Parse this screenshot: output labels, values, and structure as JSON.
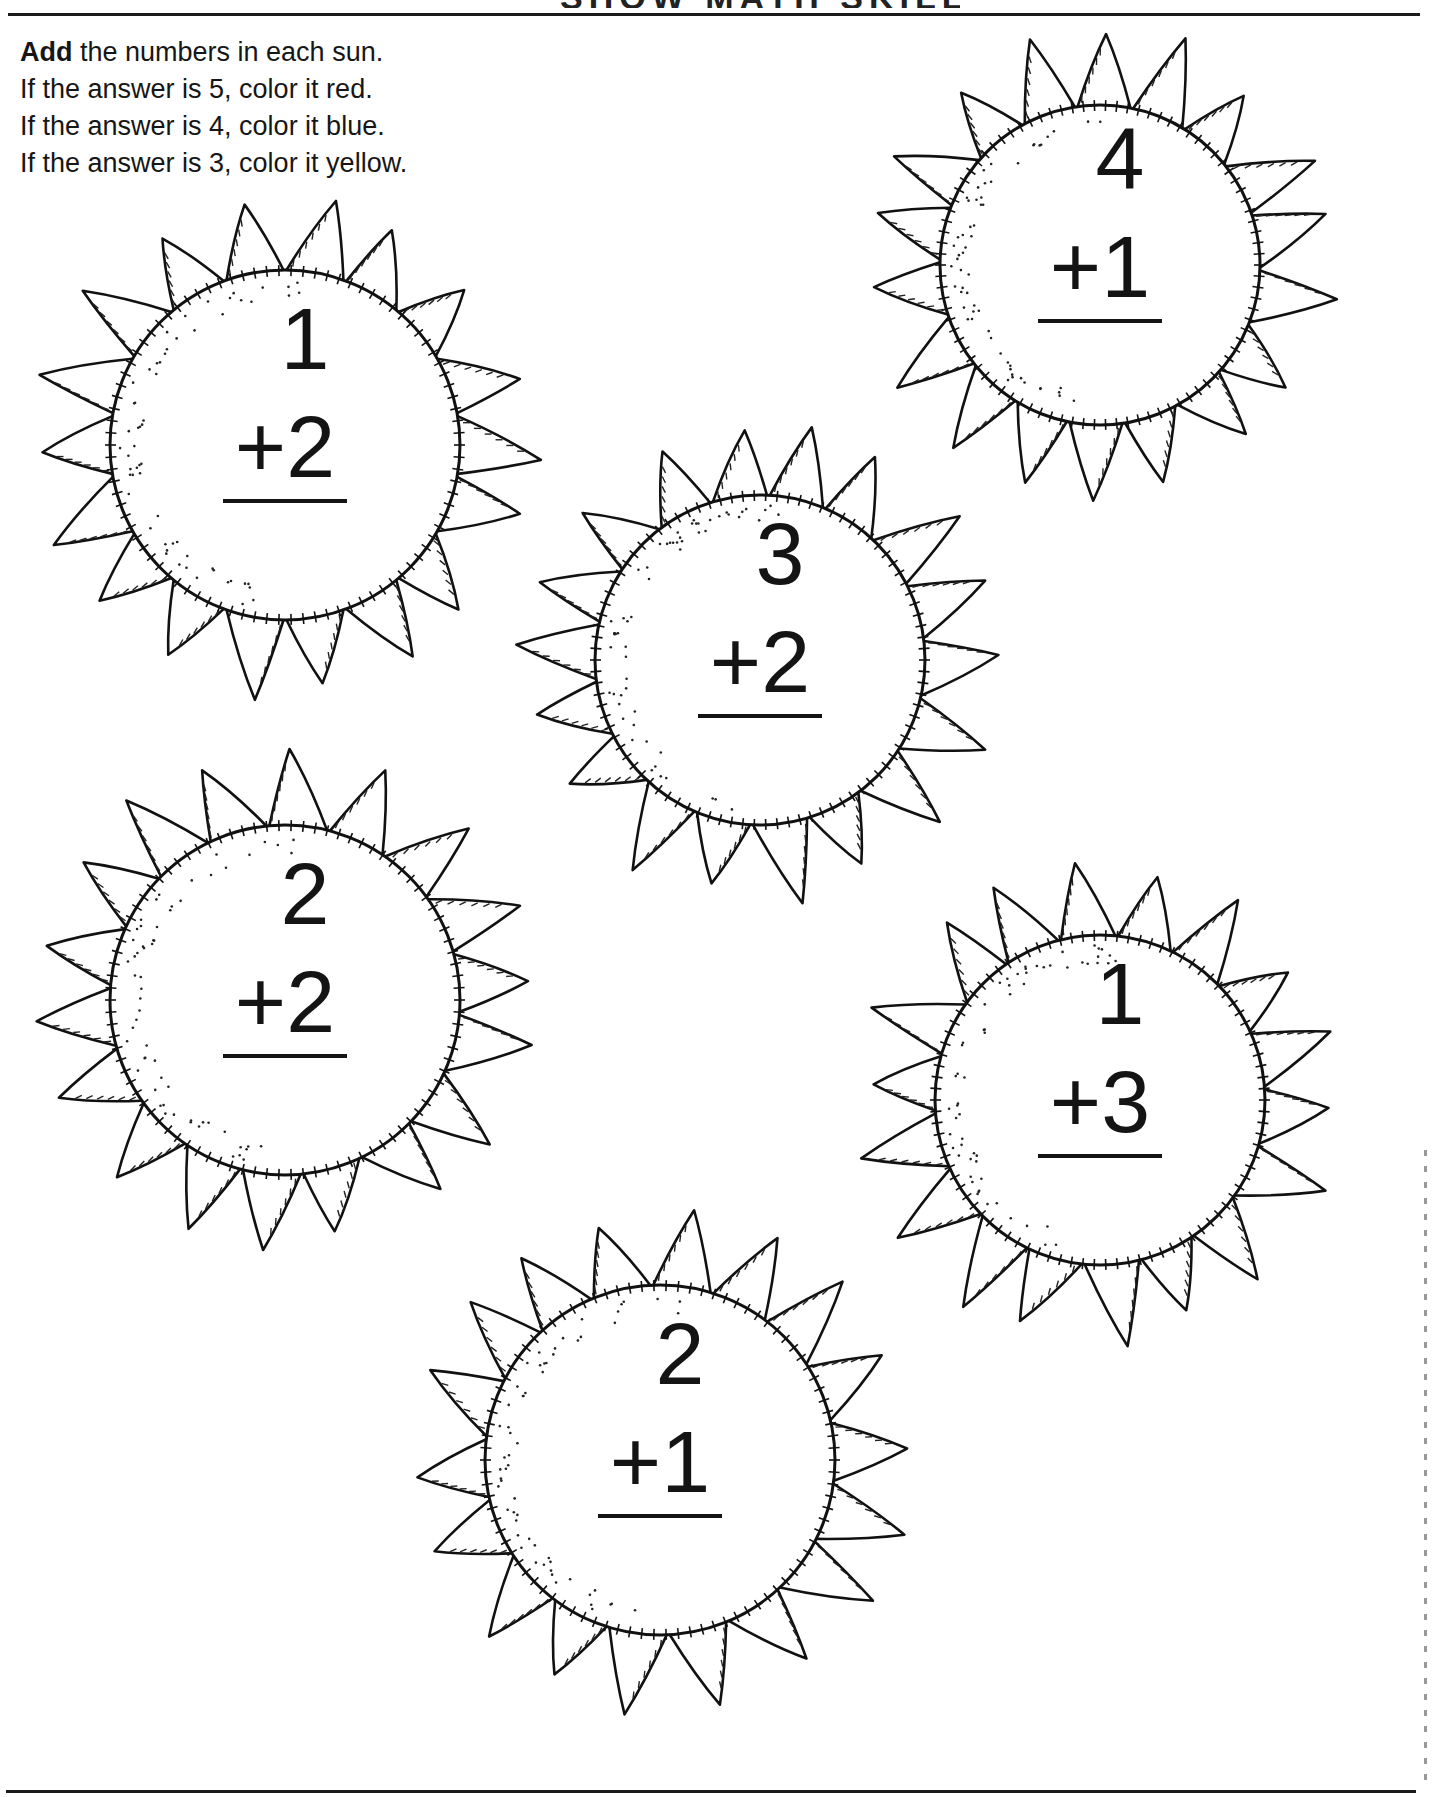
{
  "page": {
    "header_title_partial": "SHOW MATH SKILLS",
    "instructions": {
      "line1_bold": "Add",
      "line1_rest": " the numbers in each sun.",
      "line2": "If the answer is 5, color it red.",
      "line3": "If the answer is 4, color it blue.",
      "line4": "If the answer is 3, color it yellow."
    },
    "color_rules": [
      {
        "answer": 5,
        "color_name": "red",
        "color": "#e02020"
      },
      {
        "answer": 4,
        "color_name": "blue",
        "color": "#2050d0"
      },
      {
        "answer": 3,
        "color_name": "yellow",
        "color": "#f5d800"
      }
    ],
    "suns": [
      {
        "id": "sun-1",
        "top": "1",
        "bottom": "+2",
        "cx": 285,
        "cy": 445,
        "r": 175
      },
      {
        "id": "sun-2",
        "top": "4",
        "bottom": "+1",
        "cx": 1100,
        "cy": 265,
        "r": 160
      },
      {
        "id": "sun-3",
        "top": "3",
        "bottom": "+2",
        "cx": 760,
        "cy": 660,
        "r": 165
      },
      {
        "id": "sun-4",
        "top": "2",
        "bottom": "+2",
        "cx": 285,
        "cy": 1000,
        "r": 175
      },
      {
        "id": "sun-5",
        "top": "1",
        "bottom": "+3",
        "cx": 1100,
        "cy": 1100,
        "r": 165
      },
      {
        "id": "sun-6",
        "top": "2",
        "bottom": "+1",
        "cx": 660,
        "cy": 1460,
        "r": 175
      }
    ]
  }
}
